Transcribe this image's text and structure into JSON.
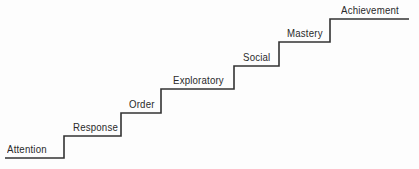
{
  "diagram": {
    "type": "staircase",
    "line_color": "#333333",
    "steps": [
      {
        "label": "Attention",
        "x1": 5,
        "x2": 64,
        "y": 158,
        "label_x": 7,
        "label_y": 143
      },
      {
        "label": "Response",
        "x1": 64,
        "x2": 121,
        "y": 136,
        "label_x": 73,
        "label_y": 121
      },
      {
        "label": "Order",
        "x1": 121,
        "x2": 161,
        "y": 113,
        "label_x": 129,
        "label_y": 98
      },
      {
        "label": "Exploratory",
        "x1": 161,
        "x2": 234,
        "y": 89,
        "label_x": 173,
        "label_y": 74
      },
      {
        "label": "Social",
        "x1": 234,
        "x2": 279,
        "y": 66,
        "label_x": 243,
        "label_y": 51
      },
      {
        "label": "Mastery",
        "x1": 279,
        "x2": 330,
        "y": 42,
        "label_x": 287,
        "label_y": 27
      },
      {
        "label": "Achievement",
        "x1": 330,
        "x2": 409,
        "y": 19,
        "label_x": 341,
        "label_y": 4
      }
    ]
  }
}
